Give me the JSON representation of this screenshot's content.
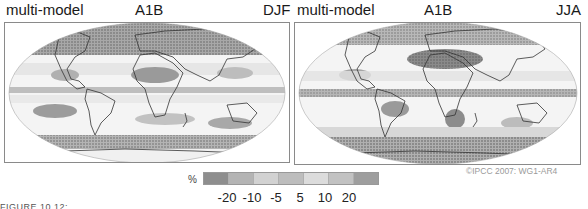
{
  "panels": [
    {
      "title_left": "multi-model",
      "title_center": "A1B",
      "title_right": "DJF",
      "season": "DJF",
      "scenario": "A1B"
    },
    {
      "title_left": "multi-model",
      "title_center": "A1B",
      "title_right": "JJA",
      "season": "JJA",
      "scenario": "A1B"
    }
  ],
  "legend": {
    "unit": "%",
    "ticks": [
      "-20",
      "-10",
      "-5",
      "5",
      "10",
      "20"
    ],
    "colors": [
      "#8e8e8e",
      "#b4b4b4",
      "#d2d2d2",
      "#bdbdbd",
      "#dcdcdc",
      "#c2c2c2",
      "#9e9e9e"
    ]
  },
  "credit": "©IPCC 2007: WG1-AR4",
  "caption": "FIGURE 10.12: ..."
}
